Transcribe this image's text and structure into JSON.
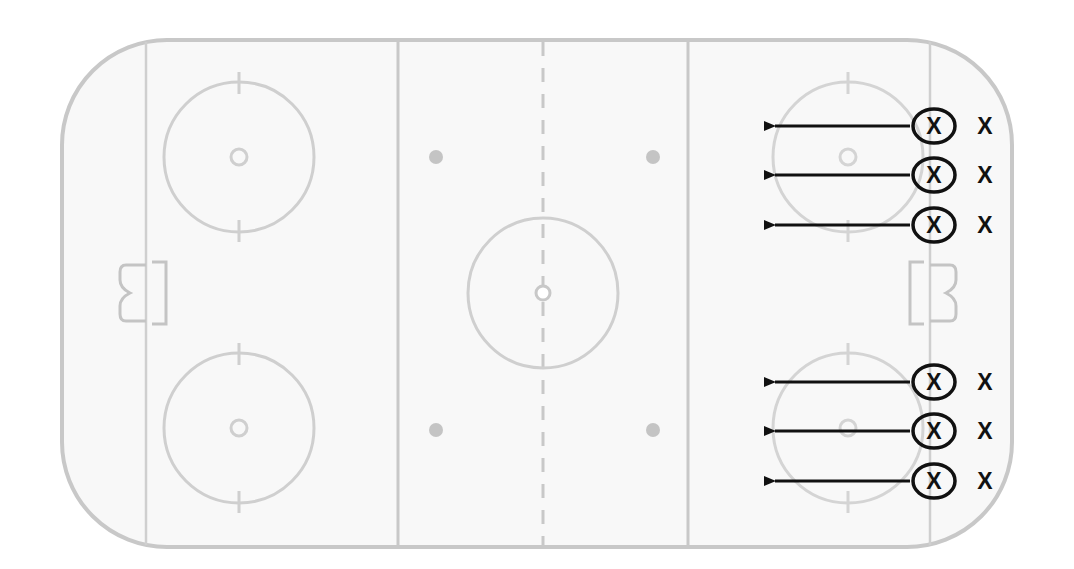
{
  "diagram": {
    "type": "hockey-rink-drill",
    "colors": {
      "rink_line": "#c8c8c8",
      "rink_fill": "#f8f8f8",
      "ink": "#111111"
    },
    "rink": {
      "left": 62,
      "top": 40,
      "right": 1012,
      "bottom": 547,
      "corner_radius": 105,
      "goal_lines_x": [
        146,
        930
      ],
      "blue_lines_x": [
        398,
        688
      ],
      "center_line_x": 543,
      "center_circle": {
        "cx": 543,
        "cy": 293,
        "r": 75
      },
      "faceoff_circles": [
        {
          "cx": 239,
          "cy": 157,
          "r": 75
        },
        {
          "cx": 239,
          "cy": 428,
          "r": 75
        },
        {
          "cx": 848,
          "cy": 157,
          "r": 75
        },
        {
          "cx": 848,
          "cy": 428,
          "r": 75
        }
      ],
      "neutral_dots": [
        {
          "cx": 436,
          "cy": 157
        },
        {
          "cx": 653,
          "cy": 157
        },
        {
          "cx": 436,
          "cy": 430
        },
        {
          "cx": 653,
          "cy": 430
        }
      ]
    },
    "players": [
      {
        "label": "X",
        "circled_label": "X",
        "y": 126,
        "arrow_from": 910,
        "arrow_to": 765
      },
      {
        "label": "X",
        "circled_label": "X",
        "y": 175,
        "arrow_from": 910,
        "arrow_to": 765
      },
      {
        "label": "X",
        "circled_label": "X",
        "y": 225,
        "arrow_from": 910,
        "arrow_to": 765
      },
      {
        "label": "X",
        "circled_label": "X",
        "y": 382,
        "arrow_from": 910,
        "arrow_to": 765
      },
      {
        "label": "X",
        "circled_label": "X",
        "y": 431,
        "arrow_from": 910,
        "arrow_to": 765
      },
      {
        "label": "X",
        "circled_label": "X",
        "y": 481,
        "arrow_from": 910,
        "arrow_to": 765
      }
    ]
  }
}
